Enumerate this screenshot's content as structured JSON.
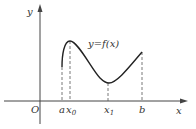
{
  "diagram": {
    "type": "function-graph",
    "axes": {
      "x_label": "x",
      "y_label": "y",
      "origin_label": "O"
    },
    "curve_label": "y=f(x)",
    "x_ticks": [
      {
        "label": "a",
        "sub": ""
      },
      {
        "label": "x",
        "sub": "0"
      },
      {
        "label": "x",
        "sub": "1"
      },
      {
        "label": "b",
        "sub": ""
      }
    ],
    "colors": {
      "stroke": "#333333",
      "background": "#ffffff"
    }
  }
}
